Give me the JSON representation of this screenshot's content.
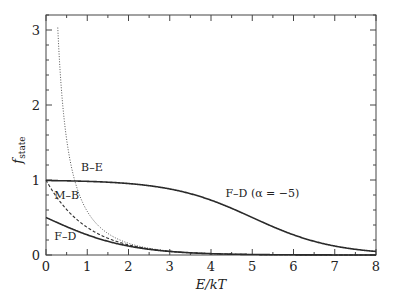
{
  "chart_data": {
    "type": "line",
    "title": "",
    "xlabel": "E/kT",
    "ylabel": "f_state",
    "ylabel_main": "f",
    "ylabel_sub": "state",
    "xlim": [
      0,
      8
    ],
    "ylim": [
      0,
      3.2
    ],
    "grid": false,
    "legend": "inline labels",
    "x_ticks": [
      "0",
      "1",
      "2",
      "3",
      "4",
      "5",
      "6",
      "7",
      "8"
    ],
    "y_ticks": [
      "0",
      "1",
      "2",
      "3"
    ],
    "series": [
      {
        "name": "B-E",
        "label": "B–E",
        "style": "dotted",
        "formula": "1/(exp(x)-1)",
        "x": [
          0.3,
          0.4,
          0.5,
          0.75,
          1,
          1.5,
          2,
          3,
          4,
          5,
          6,
          7,
          8
        ],
        "values": [
          2.86,
          2.03,
          1.54,
          0.9,
          0.58,
          0.29,
          0.16,
          0.05,
          0.02,
          0.01,
          0.0,
          0.0,
          0.0
        ]
      },
      {
        "name": "M-B",
        "label": "M–B",
        "style": "dashed",
        "formula": "exp(-x)",
        "x": [
          0,
          0.5,
          1,
          1.5,
          2,
          3,
          4,
          5,
          6,
          7,
          8
        ],
        "values": [
          1.0,
          0.61,
          0.37,
          0.22,
          0.14,
          0.05,
          0.02,
          0.01,
          0.0,
          0.0,
          0.0
        ]
      },
      {
        "name": "F-D",
        "label": "F–D",
        "style": "solid",
        "formula": "1/(exp(x)+1)",
        "x": [
          0,
          0.5,
          1,
          1.5,
          2,
          3,
          4,
          5,
          6,
          7,
          8
        ],
        "values": [
          0.5,
          0.38,
          0.27,
          0.18,
          0.12,
          0.05,
          0.02,
          0.01,
          0.0,
          0.0,
          0.0
        ]
      },
      {
        "name": "F-D (alpha=-5)",
        "label": "F–D (α = −5)",
        "style": "solid",
        "formula": "1/(exp(x-5)+1)",
        "x": [
          0,
          1,
          2,
          3,
          4,
          5,
          6,
          7,
          8
        ],
        "values": [
          0.99,
          0.98,
          0.95,
          0.88,
          0.73,
          0.5,
          0.27,
          0.12,
          0.05
        ]
      }
    ],
    "annotations": [
      {
        "text": "B–E",
        "x": 0.85,
        "y": 1.12
      },
      {
        "text": "M–B",
        "x": 0.2,
        "y": 0.75
      },
      {
        "text": "F–D",
        "x": 0.2,
        "y": 0.2
      },
      {
        "text": "F–D (α = −5)",
        "x": 4.35,
        "y": 0.77
      }
    ]
  }
}
